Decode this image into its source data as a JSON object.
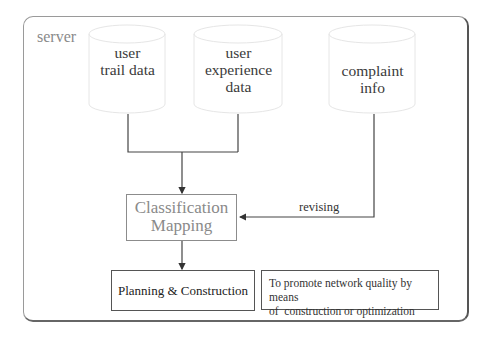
{
  "diagram": {
    "container_label": "server",
    "data_sources": [
      {
        "id": "user-trail-data",
        "lines": [
          "user",
          "trail data"
        ]
      },
      {
        "id": "user-experience-data",
        "lines": [
          "user",
          "experience",
          "data"
        ]
      },
      {
        "id": "complaint-info",
        "lines": [
          "complaint",
          "info"
        ]
      }
    ],
    "process": {
      "lines": [
        "Classification",
        "Mapping"
      ]
    },
    "feedback_label": "revising",
    "output": {
      "label": "Planning & Construction"
    },
    "note": {
      "lines": [
        "To promote network quality by means",
        "of  construction or optimization"
      ]
    },
    "edges": [
      {
        "from": "user-trail-data",
        "to": "process"
      },
      {
        "from": "user-experience-data",
        "to": "process"
      },
      {
        "from": "complaint-info",
        "to": "process",
        "label": "revising"
      },
      {
        "from": "process",
        "to": "output"
      }
    ]
  }
}
